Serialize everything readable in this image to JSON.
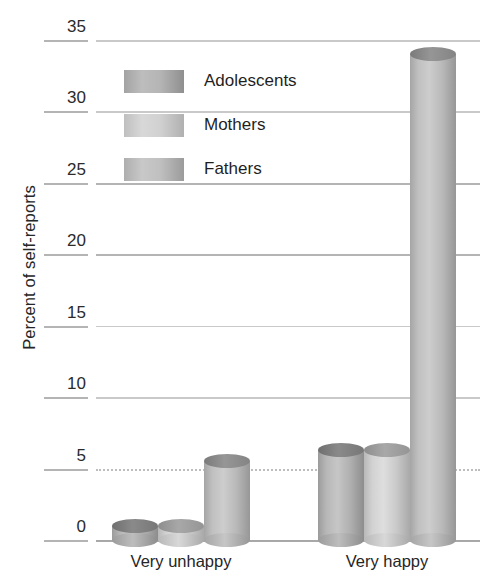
{
  "chart_data": {
    "type": "bar",
    "title": "",
    "subtitle": "",
    "xlabel": "",
    "ylabel": "Percent of self-reports",
    "categories": [
      "Very unhappy",
      "Very happy"
    ],
    "series": [
      {
        "name": "Adolescents",
        "values": [
          1.0,
          6.3
        ],
        "color": "#b0b0b0"
      },
      {
        "name": "Mothers",
        "values": [
          1.0,
          6.3
        ],
        "color": "#d2d2d2"
      },
      {
        "name": "Fathers",
        "values": [
          5.5,
          34.0
        ],
        "color": "#bdbdbd"
      }
    ],
    "ylim": [
      0,
      35
    ],
    "yticks": [
      0,
      5,
      10,
      15,
      20,
      25,
      30,
      35
    ],
    "ytick_labels": [
      "0",
      "5",
      "10",
      "15",
      "20",
      "25",
      "30",
      "35"
    ],
    "grid": true,
    "grid_axis": "y",
    "legend_position": "upper-left-inside",
    "bar_style": "3d-cylinder",
    "palette": "grayscale"
  },
  "axes": {
    "y_title": "Percent of self-reports",
    "y_ticks": [
      "0",
      "5",
      "10",
      "15",
      "20",
      "25",
      "30",
      "35"
    ],
    "x_ticks": [
      "Very unhappy",
      "Very happy"
    ]
  },
  "legend": {
    "items": [
      {
        "label": "Adolescents",
        "swatch": "legend-swatch-adolescents"
      },
      {
        "label": "Mothers",
        "swatch": "legend-swatch-mothers"
      },
      {
        "label": "Fathers",
        "swatch": "legend-swatch-fathers"
      }
    ]
  }
}
